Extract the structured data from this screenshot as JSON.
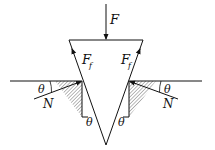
{
  "diagram": {
    "labels": {
      "applied_force": "F",
      "friction_left": "F",
      "friction_left_sub": "f",
      "friction_right": "F",
      "friction_right_sub": "f",
      "normal_left": "N",
      "normal_right": "N",
      "theta_left_outer": "θ",
      "theta_right_outer": "θ",
      "theta_left_inner": "θ",
      "theta_right_inner": "θ"
    },
    "colors": {
      "line": "#111111",
      "hatch": "#9a9a9a",
      "background": "#ffffff"
    }
  }
}
